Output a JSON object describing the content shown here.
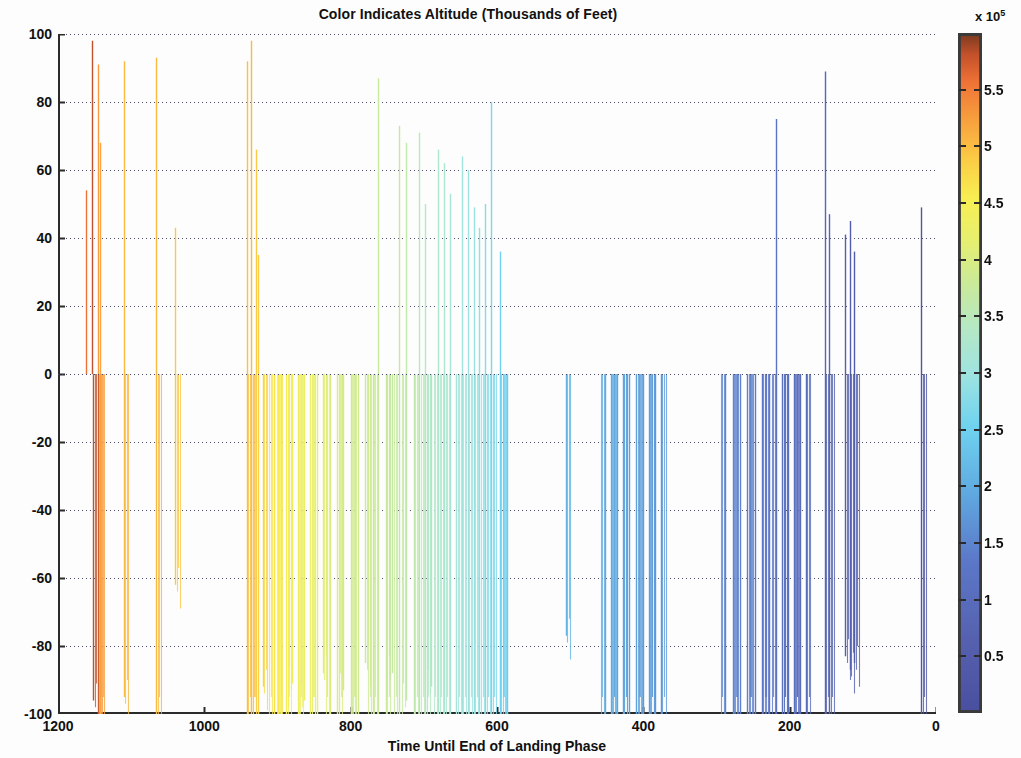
{
  "chart_data": {
    "type": "bar",
    "title": "Color Indicates Altitude (Thousands of Feet)",
    "xlabel": "Time Until End of Landing Phase",
    "ylabel": "Confidence %",
    "xlim": [
      1200,
      0
    ],
    "ylim": [
      -100,
      100
    ],
    "x_reversed": true,
    "grid": "horizontal-dotted",
    "legend": "none",
    "colorbar": {
      "label_multiplier": "x 10",
      "label_exponent": "5",
      "ticks": [
        0.5,
        1,
        1.5,
        2,
        2.5,
        3,
        3.5,
        4,
        4.5,
        5,
        5.5
      ],
      "tick_labels": [
        "0.5",
        "1",
        "1.5",
        "2",
        "2.5",
        "3",
        "3.5",
        "4",
        "4.5",
        "5",
        "5.5"
      ],
      "vmin": 0,
      "vmax": 600000,
      "colormap": "jet-like",
      "stops": [
        {
          "pos": 0.0,
          "color": "#4a4fa0"
        },
        {
          "pos": 0.1,
          "color": "#5560ae"
        },
        {
          "pos": 0.22,
          "color": "#5c77c8"
        },
        {
          "pos": 0.32,
          "color": "#5fa8e0"
        },
        {
          "pos": 0.42,
          "color": "#6fd3ef"
        },
        {
          "pos": 0.5,
          "color": "#9fe3e0"
        },
        {
          "pos": 0.57,
          "color": "#b6e8c4"
        },
        {
          "pos": 0.64,
          "color": "#cdea95"
        },
        {
          "pos": 0.7,
          "color": "#e8ef6d"
        },
        {
          "pos": 0.76,
          "color": "#f8ee52"
        },
        {
          "pos": 0.82,
          "color": "#fbc944"
        },
        {
          "pos": 0.88,
          "color": "#f79b3d"
        },
        {
          "pos": 0.93,
          "color": "#ef7236"
        },
        {
          "pos": 0.97,
          "color": "#c4512b"
        },
        {
          "pos": 1.0,
          "color": "#7d3b20"
        }
      ]
    },
    "x_ticks": [
      1200,
      1000,
      800,
      600,
      400,
      200,
      0
    ],
    "x_tick_labels": [
      "1200",
      "1000",
      "800",
      "600",
      "400",
      "200",
      "0"
    ],
    "y_ticks": [
      100,
      80,
      60,
      40,
      20,
      0,
      -20,
      -40,
      -60,
      -80,
      -100
    ],
    "y_tick_labels": [
      "100",
      "80",
      "60",
      "40",
      "20",
      "0",
      "-20",
      "-40",
      "-60",
      "-80",
      "-100"
    ],
    "points": [
      {
        "x": 1162,
        "y": 54,
        "c": 0.93
      },
      {
        "x": 1154,
        "y": 98,
        "c": 0.97
      },
      {
        "x": 1152,
        "y": -96,
        "c": 0.97
      },
      {
        "x": 1146,
        "y": 91,
        "c": 0.88
      },
      {
        "x": 1146,
        "y": -100,
        "c": 0.88
      },
      {
        "x": 1143,
        "y": 68,
        "c": 0.87
      },
      {
        "x": 1143,
        "y": -100,
        "c": 0.87
      },
      {
        "x": 1110,
        "y": 92,
        "c": 0.84
      },
      {
        "x": 1110,
        "y": -95,
        "c": 0.84
      },
      {
        "x": 1066,
        "y": 93,
        "c": 0.84
      },
      {
        "x": 1066,
        "y": -100,
        "c": 0.84
      },
      {
        "x": 1040,
        "y": 43,
        "c": 0.82
      },
      {
        "x": 1040,
        "y": -62,
        "c": 0.82
      },
      {
        "x": 942,
        "y": 92,
        "c": 0.83
      },
      {
        "x": 942,
        "y": -100,
        "c": 0.83
      },
      {
        "x": 936,
        "y": 98,
        "c": 0.84
      },
      {
        "x": 936,
        "y": -100,
        "c": 0.84
      },
      {
        "x": 930,
        "y": 66,
        "c": 0.82
      },
      {
        "x": 927,
        "y": 35,
        "c": 0.81
      },
      {
        "x": 927,
        "y": -100,
        "c": 0.81
      },
      {
        "x": 920,
        "y": -92,
        "c": 0.8
      },
      {
        "x": 905,
        "y": -100,
        "c": 0.78
      },
      {
        "x": 900,
        "y": -100,
        "c": 0.77
      },
      {
        "x": 895,
        "y": -100,
        "c": 0.76
      },
      {
        "x": 888,
        "y": -100,
        "c": 0.75
      },
      {
        "x": 880,
        "y": -91,
        "c": 0.74
      },
      {
        "x": 872,
        "y": -100,
        "c": 0.73
      },
      {
        "x": 864,
        "y": -96,
        "c": 0.72
      },
      {
        "x": 855,
        "y": -100,
        "c": 0.71
      },
      {
        "x": 846,
        "y": -100,
        "c": 0.7
      },
      {
        "x": 838,
        "y": -88,
        "c": 0.69
      },
      {
        "x": 828,
        "y": -100,
        "c": 0.68
      },
      {
        "x": 818,
        "y": -100,
        "c": 0.67
      },
      {
        "x": 810,
        "y": -93,
        "c": 0.66
      },
      {
        "x": 800,
        "y": -100,
        "c": 0.65
      },
      {
        "x": 790,
        "y": -100,
        "c": 0.65
      },
      {
        "x": 780,
        "y": -85,
        "c": 0.64
      },
      {
        "x": 770,
        "y": -100,
        "c": 0.64
      },
      {
        "x": 762,
        "y": 87,
        "c": 0.63
      },
      {
        "x": 762,
        "y": -100,
        "c": 0.63
      },
      {
        "x": 752,
        "y": -100,
        "c": 0.63
      },
      {
        "x": 744,
        "y": -88,
        "c": 0.62
      },
      {
        "x": 734,
        "y": 73,
        "c": 0.62
      },
      {
        "x": 734,
        "y": -100,
        "c": 0.62
      },
      {
        "x": 724,
        "y": 68,
        "c": 0.61
      },
      {
        "x": 724,
        "y": -96,
        "c": 0.61
      },
      {
        "x": 714,
        "y": -100,
        "c": 0.6
      },
      {
        "x": 706,
        "y": 71,
        "c": 0.58
      },
      {
        "x": 706,
        "y": -100,
        "c": 0.58
      },
      {
        "x": 698,
        "y": 50,
        "c": 0.57
      },
      {
        "x": 698,
        "y": -100,
        "c": 0.57
      },
      {
        "x": 690,
        "y": -92,
        "c": 0.56
      },
      {
        "x": 680,
        "y": 66,
        "c": 0.55
      },
      {
        "x": 680,
        "y": -100,
        "c": 0.55
      },
      {
        "x": 672,
        "y": 62,
        "c": 0.54
      },
      {
        "x": 672,
        "y": -100,
        "c": 0.54
      },
      {
        "x": 664,
        "y": 53,
        "c": 0.53
      },
      {
        "x": 664,
        "y": -100,
        "c": 0.53
      },
      {
        "x": 656,
        "y": -100,
        "c": 0.52
      },
      {
        "x": 648,
        "y": 64,
        "c": 0.51
      },
      {
        "x": 648,
        "y": -100,
        "c": 0.51
      },
      {
        "x": 640,
        "y": 60,
        "c": 0.5
      },
      {
        "x": 640,
        "y": -100,
        "c": 0.5
      },
      {
        "x": 632,
        "y": 49,
        "c": 0.49
      },
      {
        "x": 632,
        "y": -100,
        "c": 0.49
      },
      {
        "x": 624,
        "y": 43,
        "c": 0.48
      },
      {
        "x": 624,
        "y": -100,
        "c": 0.48
      },
      {
        "x": 616,
        "y": 50,
        "c": 0.46
      },
      {
        "x": 616,
        "y": -100,
        "c": 0.46
      },
      {
        "x": 608,
        "y": 80,
        "c": 0.44
      },
      {
        "x": 608,
        "y": -100,
        "c": 0.44
      },
      {
        "x": 596,
        "y": 36,
        "c": 0.42
      },
      {
        "x": 596,
        "y": -100,
        "c": 0.42
      },
      {
        "x": 586,
        "y": -100,
        "c": 0.41
      },
      {
        "x": 506,
        "y": -77,
        "c": 0.35
      },
      {
        "x": 452,
        "y": -100,
        "c": 0.33
      },
      {
        "x": 444,
        "y": -100,
        "c": 0.33
      },
      {
        "x": 436,
        "y": -100,
        "c": 0.32
      },
      {
        "x": 428,
        "y": -100,
        "c": 0.32
      },
      {
        "x": 420,
        "y": -100,
        "c": 0.31
      },
      {
        "x": 410,
        "y": -100,
        "c": 0.31
      },
      {
        "x": 400,
        "y": -100,
        "c": 0.3
      },
      {
        "x": 392,
        "y": -100,
        "c": 0.3
      },
      {
        "x": 384,
        "y": -100,
        "c": 0.29
      },
      {
        "x": 376,
        "y": -100,
        "c": 0.29
      },
      {
        "x": 288,
        "y": -100,
        "c": 0.25
      },
      {
        "x": 278,
        "y": -100,
        "c": 0.25
      },
      {
        "x": 268,
        "y": -100,
        "c": 0.24
      },
      {
        "x": 258,
        "y": -100,
        "c": 0.24
      },
      {
        "x": 248,
        "y": -100,
        "c": 0.23
      },
      {
        "x": 238,
        "y": -100,
        "c": 0.22
      },
      {
        "x": 228,
        "y": -100,
        "c": 0.22
      },
      {
        "x": 218,
        "y": 75,
        "c": 0.2
      },
      {
        "x": 218,
        "y": -100,
        "c": 0.2
      },
      {
        "x": 210,
        "y": -100,
        "c": 0.19
      },
      {
        "x": 202,
        "y": -100,
        "c": 0.19
      },
      {
        "x": 194,
        "y": -100,
        "c": 0.18
      },
      {
        "x": 186,
        "y": -100,
        "c": 0.17
      },
      {
        "x": 178,
        "y": -100,
        "c": 0.17
      },
      {
        "x": 152,
        "y": 89,
        "c": 0.13
      },
      {
        "x": 152,
        "y": -100,
        "c": 0.13
      },
      {
        "x": 146,
        "y": 47,
        "c": 0.12
      },
      {
        "x": 146,
        "y": -100,
        "c": 0.12
      },
      {
        "x": 124,
        "y": 41,
        "c": 0.1
      },
      {
        "x": 124,
        "y": -83,
        "c": 0.1
      },
      {
        "x": 118,
        "y": 45,
        "c": 0.09
      },
      {
        "x": 118,
        "y": -87,
        "c": 0.09
      },
      {
        "x": 112,
        "y": 36,
        "c": 0.08
      },
      {
        "x": 112,
        "y": -85,
        "c": 0.08
      },
      {
        "x": 20,
        "y": 49,
        "c": 0.04
      },
      {
        "x": 20,
        "y": -100,
        "c": 0.04
      }
    ]
  },
  "axes": {
    "y_label": "Confidence %",
    "x_label": "Time Until End of Landing Phase"
  }
}
